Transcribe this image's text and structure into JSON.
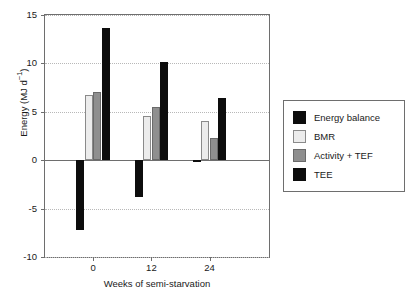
{
  "chart_data": {
    "type": "bar",
    "title": "",
    "xlabel": "Weeks of semi-starvation",
    "ylabel": "Energy (MJ d⁻¹)",
    "ylabel_parts": {
      "text": "Energy (MJ d",
      "sup": "−1",
      "tail": ")"
    },
    "categories": [
      "0",
      "12",
      "24"
    ],
    "ylim": [
      -10,
      15
    ],
    "yticks": [
      15,
      10,
      5,
      0,
      -5,
      -10
    ],
    "ytick_labels": [
      "15",
      "10",
      "5",
      "0",
      "-5",
      "-10"
    ],
    "grid": "horizontal-dotted",
    "legend_position": "right-outside",
    "series": [
      {
        "name": "Energy balance",
        "color": "#0d0d0d",
        "values": [
          -7.2,
          -3.8,
          -0.2
        ]
      },
      {
        "name": "BMR",
        "color": "#ececec",
        "values": [
          6.7,
          4.6,
          4.1
        ]
      },
      {
        "name": "Activity + TEF",
        "color": "#8f8f8f",
        "values": [
          7.0,
          5.5,
          2.3
        ]
      },
      {
        "name": "TEE",
        "color": "#0d0d0d",
        "values": [
          13.7,
          10.1,
          6.4
        ]
      }
    ]
  },
  "legend": {
    "items": [
      {
        "label": "Energy balance",
        "swatch": "black-swatch"
      },
      {
        "label": "BMR",
        "swatch": "light-gray-swatch"
      },
      {
        "label": "Activity + TEF",
        "swatch": "mid-gray-swatch"
      },
      {
        "label": "TEE",
        "swatch": "black-swatch"
      }
    ]
  },
  "axes": {
    "y_tick_labels": [
      "15",
      "10",
      "5",
      "0",
      "-5",
      "-10"
    ],
    "x_tick_labels": [
      "0",
      "12",
      "24"
    ],
    "x_axis_title": "Weeks of semi-starvation"
  }
}
